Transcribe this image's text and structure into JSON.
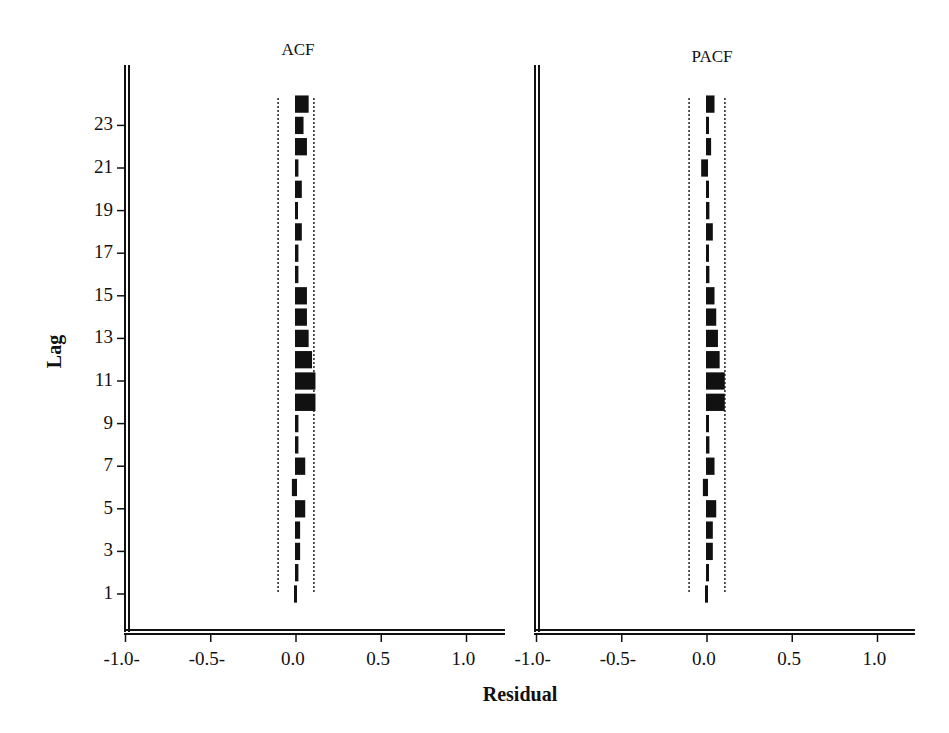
{
  "chart_data": [
    {
      "type": "bar",
      "orientation": "horizontal",
      "title": "ACF",
      "xlabel": "Residual",
      "ylabel": "Lag",
      "xlim": [
        -1.0,
        1.2
      ],
      "ylim": [
        0,
        25
      ],
      "x_ticks": [
        "-1.0-",
        "-0.5-",
        "0.0",
        "0.5",
        "1.0"
      ],
      "y_ticks": [
        "1",
        "3",
        "5",
        "7",
        "9",
        "11",
        "13",
        "15",
        "17",
        "19",
        "21",
        "23"
      ],
      "confidence_limits": [
        -0.1,
        0.1
      ],
      "categories": [
        1,
        2,
        3,
        4,
        5,
        6,
        7,
        8,
        9,
        10,
        11,
        12,
        13,
        14,
        15,
        16,
        17,
        18,
        19,
        20,
        21,
        22,
        23,
        24
      ],
      "values": [
        -0.01,
        0.02,
        0.03,
        0.03,
        0.06,
        -0.03,
        0.06,
        0.02,
        0.02,
        0.12,
        0.12,
        0.1,
        0.08,
        0.07,
        0.07,
        0.02,
        0.02,
        0.04,
        0.01,
        0.04,
        0.02,
        0.07,
        0.05,
        0.08
      ],
      "grid": false
    },
    {
      "type": "bar",
      "orientation": "horizontal",
      "title": "PACF",
      "xlabel": "Residual",
      "ylabel": "Lag",
      "xlim": [
        -1.0,
        1.2
      ],
      "ylim": [
        0,
        25
      ],
      "x_ticks": [
        "-1.0-",
        "-0.5-",
        "0.0",
        "0.5",
        "1.0"
      ],
      "confidence_limits": [
        -0.1,
        0.1
      ],
      "categories": [
        1,
        2,
        3,
        4,
        5,
        6,
        7,
        8,
        9,
        10,
        11,
        12,
        13,
        14,
        15,
        16,
        17,
        18,
        19,
        20,
        21,
        22,
        23,
        24
      ],
      "values": [
        -0.01,
        0.01,
        0.04,
        0.04,
        0.06,
        -0.03,
        0.05,
        0.02,
        0.01,
        0.11,
        0.11,
        0.08,
        0.07,
        0.06,
        0.05,
        0.02,
        0.01,
        0.04,
        0.02,
        0.01,
        -0.04,
        0.03,
        0.01,
        0.05
      ],
      "grid": false
    }
  ],
  "labels": {
    "acf_title": "ACF",
    "pacf_title": "PACF",
    "y_axis": "Lag",
    "x_axis": "Residual"
  }
}
